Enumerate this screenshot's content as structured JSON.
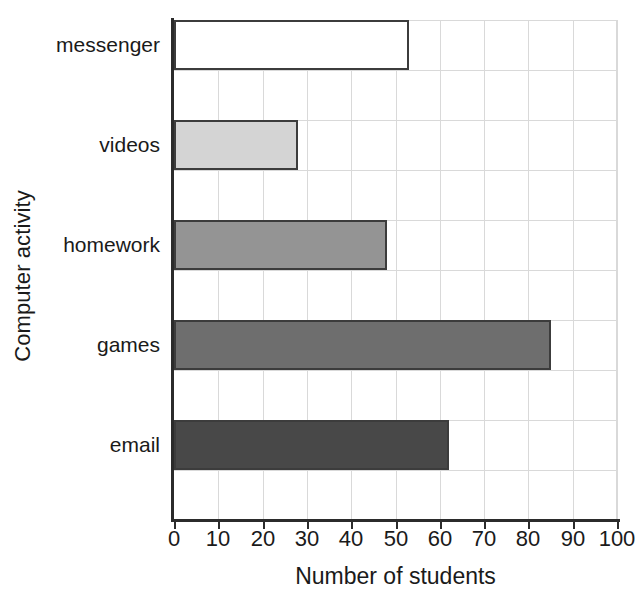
{
  "chart_data": {
    "type": "bar",
    "orientation": "horizontal",
    "title": "",
    "xlabel": "Number of students",
    "ylabel": "Computer activity",
    "categories": [
      "email",
      "games",
      "homework",
      "videos",
      "messenger"
    ],
    "values": [
      62,
      85,
      48,
      28,
      53
    ],
    "bar_colors": [
      "#484848",
      "#6e6e6e",
      "#949494",
      "#d4d4d4",
      "#ffffff"
    ],
    "bar_edge_color": "#3c3c3c",
    "xlim": [
      0,
      100
    ],
    "xticks": [
      0,
      10,
      20,
      30,
      40,
      50,
      60,
      70,
      80,
      90,
      100
    ],
    "xtick_labels": [
      "0",
      "10",
      "20",
      "30",
      "40",
      "50",
      "60",
      "70",
      "80",
      "90",
      "100"
    ],
    "grid": true,
    "legend": false,
    "series": [
      {
        "name": "Number of students",
        "points": [
          {
            "category": "email",
            "value": 62,
            "color": "#484848"
          },
          {
            "category": "games",
            "value": 85,
            "color": "#6e6e6e"
          },
          {
            "category": "homework",
            "value": 48,
            "color": "#949494"
          },
          {
            "category": "videos",
            "value": 28,
            "color": "#d4d4d4"
          },
          {
            "category": "messenger",
            "value": 53,
            "color": "#ffffff"
          }
        ]
      }
    ]
  },
  "axes": {
    "y_title": "Computer activity",
    "x_title": "Number of students",
    "y_tick_labels": [
      "messenger",
      "videos",
      "homework",
      "games",
      "email"
    ],
    "x_tick_labels": [
      "0",
      "10",
      "20",
      "30",
      "40",
      "50",
      "60",
      "70",
      "80",
      "90",
      "100"
    ]
  },
  "colors": {
    "axis": "#2b2b2b",
    "grid": "#d9d9d9",
    "text": "#1a1a1a",
    "plot_background": "#ffffff",
    "page_background": "#ffffff"
  }
}
